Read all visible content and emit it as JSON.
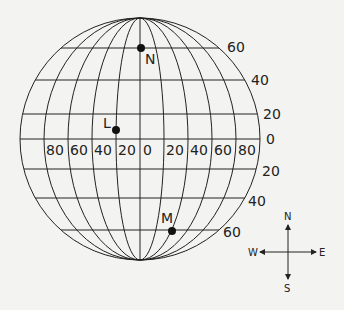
{
  "diagram": {
    "type": "globe-latitude-longitude-grid",
    "latitude_labels": {
      "north": [
        "60",
        "40",
        "20"
      ],
      "equator": "0",
      "south": [
        "20",
        "40",
        "60"
      ]
    },
    "longitude_labels": {
      "west": [
        "80",
        "60",
        "40",
        "20"
      ],
      "center": "0",
      "east": [
        "20",
        "40",
        "60",
        "80"
      ]
    },
    "points": [
      {
        "name": "N",
        "label": "N"
      },
      {
        "name": "L",
        "label": "L"
      },
      {
        "name": "M",
        "label": "M"
      }
    ],
    "compass": {
      "north": "N",
      "south": "S",
      "east": "E",
      "west": "W"
    },
    "colors": {
      "background": "#f3f3f1",
      "line": "#222222",
      "point": "#111111"
    }
  }
}
